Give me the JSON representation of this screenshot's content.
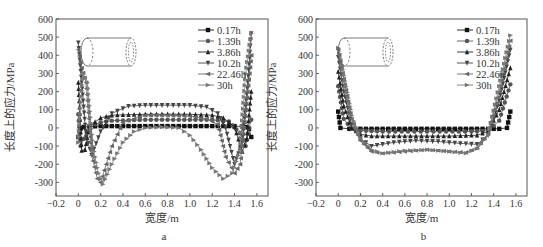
{
  "chart_data": [
    {
      "panel_label": "a",
      "type": "line",
      "title": "",
      "xlabel": "宽度/m",
      "ylabel": "长度上的应力/MPa",
      "xlim": [
        -0.2,
        1.7
      ],
      "ylim": [
        -375,
        600
      ],
      "xticks": [
        -0.2,
        0,
        0.2,
        0.4,
        0.6,
        0.8,
        1.0,
        1.2,
        1.4,
        1.6
      ],
      "xtick_labels": [
        "-0.2",
        "0",
        "0.2",
        "0.4",
        "0.6",
        "0.8",
        "1.0",
        "1.2",
        "1.4",
        "1.6"
      ],
      "yticks": [
        -300,
        -200,
        -100,
        0,
        100,
        200,
        300,
        400,
        500,
        600
      ],
      "ytick_labels": [
        "-300",
        "-200",
        "-100",
        "0",
        "100",
        "200",
        "300",
        "400",
        "500",
        "600"
      ],
      "grid": false,
      "legend_position": "upper right",
      "series": [
        {
          "name": "0.17h",
          "marker": "square",
          "x": [
            0,
            0.02,
            0.05,
            0.1,
            0.2,
            0.4,
            0.6,
            0.8,
            1.0,
            1.2,
            1.4,
            1.47,
            1.5,
            1.53,
            1.55
          ],
          "y": [
            -50,
            -5,
            5,
            8,
            10,
            10,
            10,
            10,
            10,
            10,
            10,
            8,
            5,
            -5,
            -50
          ]
        },
        {
          "name": "1.39h",
          "marker": "circle",
          "x": [
            0,
            0.02,
            0.05,
            0.1,
            0.2,
            0.3,
            0.6,
            0.8,
            1.0,
            1.2,
            1.35,
            1.45,
            1.5,
            1.53,
            1.55
          ],
          "y": [
            75,
            -100,
            -60,
            10,
            30,
            40,
            45,
            45,
            45,
            45,
            35,
            -30,
            -100,
            0,
            45
          ]
        },
        {
          "name": "3.86h",
          "marker": "triangle-up",
          "x": [
            0,
            0.03,
            0.06,
            0.1,
            0.2,
            0.3,
            0.6,
            0.8,
            1.0,
            1.2,
            1.3,
            1.4,
            1.47,
            1.51,
            1.55
          ],
          "y": [
            250,
            -125,
            -120,
            10,
            55,
            70,
            75,
            75,
            75,
            70,
            55,
            5,
            -130,
            -60,
            200
          ]
        },
        {
          "name": "10.2h",
          "marker": "triangle-down",
          "x": [
            0,
            0.03,
            0.07,
            0.12,
            0.2,
            0.3,
            0.45,
            0.6,
            0.8,
            1.0,
            1.15,
            1.25,
            1.32,
            1.4,
            1.47,
            1.52,
            1.55
          ],
          "y": [
            470,
            250,
            -50,
            -150,
            -20,
            80,
            120,
            125,
            125,
            125,
            115,
            80,
            0,
            -200,
            -80,
            250,
            520
          ]
        },
        {
          "name": "22.46h",
          "marker": "triangle-left",
          "x": [
            0,
            0.03,
            0.07,
            0.12,
            0.17,
            0.2,
            0.3,
            0.4,
            0.6,
            0.8,
            1.0,
            1.15,
            1.25,
            1.32,
            1.4,
            1.45,
            1.5,
            1.55
          ],
          "y": [
            430,
            330,
            250,
            -150,
            -280,
            -300,
            -100,
            30,
            70,
            70,
            65,
            50,
            20,
            -160,
            -250,
            -200,
            100,
            400
          ]
        },
        {
          "name": "30h",
          "marker": "triangle-right",
          "x": [
            0,
            0.04,
            0.08,
            0.13,
            0.18,
            0.22,
            0.3,
            0.4,
            0.5,
            0.6,
            0.75,
            0.9,
            1.0,
            1.1,
            1.2,
            1.3,
            1.38,
            1.45,
            1.5,
            1.55
          ],
          "y": [
            -80,
            300,
            250,
            -100,
            -250,
            -310,
            -200,
            -80,
            -20,
            0,
            5,
            0,
            -40,
            -120,
            -220,
            -280,
            -250,
            -120,
            300,
            520
          ]
        }
      ]
    },
    {
      "panel_label": "b",
      "type": "line",
      "title": "",
      "xlabel": "宽度/m",
      "ylabel": "长度上的应力/MPa",
      "xlim": [
        -0.2,
        1.7
      ],
      "ylim": [
        -375,
        600
      ],
      "xticks": [
        -0.2,
        0,
        0.2,
        0.4,
        0.6,
        0.8,
        1.0,
        1.2,
        1.4,
        1.6
      ],
      "xtick_labels": [
        "-0.2",
        "0",
        "0.2",
        "0.4",
        "0.6",
        "0.8",
        "1.0",
        "1.2",
        "1.4",
        "1.6"
      ],
      "yticks": [
        -300,
        -200,
        -100,
        0,
        100,
        200,
        300,
        400,
        500,
        600
      ],
      "ytick_labels": [
        "-300",
        "-200",
        "-100",
        "0",
        "100",
        "200",
        "300",
        "400",
        "500",
        "600"
      ],
      "grid": false,
      "legend_position": "upper right",
      "series": [
        {
          "name": "0.17h",
          "marker": "square",
          "x": [
            0,
            0.02,
            0.1,
            0.3,
            0.6,
            0.8,
            1.0,
            1.3,
            1.45,
            1.52,
            1.55
          ],
          "y": [
            90,
            0,
            -5,
            -5,
            -5,
            -5,
            -5,
            -5,
            -5,
            0,
            90
          ]
        },
        {
          "name": "1.39h",
          "marker": "circle",
          "x": [
            0,
            0.05,
            0.12,
            0.2,
            0.4,
            0.8,
            1.2,
            1.35,
            1.45,
            1.55
          ],
          "y": [
            230,
            50,
            -5,
            -15,
            -20,
            -20,
            -20,
            -15,
            40,
            240
          ]
        },
        {
          "name": "3.86h",
          "marker": "triangle-up",
          "x": [
            0,
            0.05,
            0.12,
            0.2,
            0.3,
            0.6,
            0.8,
            1.0,
            1.25,
            1.35,
            1.45,
            1.55
          ],
          "y": [
            310,
            120,
            0,
            -35,
            -45,
            -45,
            -45,
            -45,
            -40,
            -20,
            100,
            330
          ]
        },
        {
          "name": "10.2h",
          "marker": "triangle-down",
          "x": [
            0,
            0.05,
            0.12,
            0.2,
            0.3,
            0.5,
            0.7,
            0.9,
            1.1,
            1.25,
            1.35,
            1.45,
            1.55
          ],
          "y": [
            390,
            200,
            20,
            -60,
            -100,
            -80,
            -70,
            -75,
            -85,
            -90,
            -40,
            150,
            430
          ]
        },
        {
          "name": "22.46h",
          "marker": "triangle-left",
          "x": [
            0,
            0.05,
            0.12,
            0.2,
            0.3,
            0.4,
            0.6,
            0.8,
            1.0,
            1.15,
            1.25,
            1.35,
            1.45,
            1.55
          ],
          "y": [
            430,
            270,
            50,
            -70,
            -130,
            -140,
            -130,
            -120,
            -130,
            -135,
            -110,
            -30,
            200,
            480
          ]
        },
        {
          "name": "30h",
          "marker": "triangle-right",
          "x": [
            0,
            0.05,
            0.12,
            0.2,
            0.3,
            0.4,
            0.6,
            0.8,
            1.0,
            1.15,
            1.25,
            1.35,
            1.45,
            1.55
          ],
          "y": [
            440,
            290,
            70,
            -60,
            -120,
            -140,
            -125,
            -120,
            -130,
            -140,
            -115,
            -40,
            230,
            510
          ]
        }
      ]
    }
  ],
  "figure": {
    "panel_a_caption": "a",
    "panel_b_caption": "b",
    "inset": "cylinder-icon"
  }
}
